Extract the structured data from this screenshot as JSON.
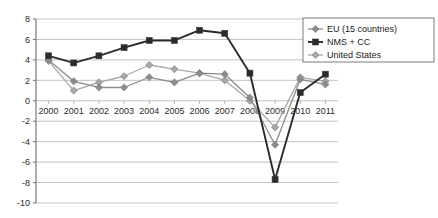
{
  "chart_data": {
    "type": "line",
    "title": "",
    "xlabel": "",
    "ylabel": "",
    "categories": [
      "2000",
      "2001",
      "2002",
      "2003",
      "2004",
      "2005",
      "2006",
      "2007",
      "2008",
      "2009",
      "2010",
      "2011"
    ],
    "x": [
      2000,
      2001,
      2002,
      2003,
      2004,
      2005,
      2006,
      2007,
      2008,
      2009,
      2010,
      2011
    ],
    "ylim": [
      -10,
      8
    ],
    "yticks": [
      8,
      6,
      4,
      2,
      0,
      -2,
      -4,
      -6,
      -8,
      -10
    ],
    "ytick_labels": [
      "8",
      "6",
      "4",
      "2",
      "0",
      "-2",
      "-4",
      "-6",
      "-8",
      "-10"
    ],
    "grid": true,
    "grid_axis": "y",
    "legend_position": "top-right",
    "series": [
      {
        "name": "EU (15 countries)",
        "color": "#8c8c8c",
        "marker": "diamond",
        "values": [
          4.0,
          1.9,
          1.3,
          1.3,
          2.3,
          1.8,
          2.7,
          2.6,
          0.3,
          -4.3,
          2.1,
          1.6
        ]
      },
      {
        "name": "NMS + CC",
        "color": "#2b2b2b",
        "marker": "square",
        "values": [
          4.4,
          3.7,
          4.4,
          5.2,
          5.9,
          5.9,
          6.9,
          6.6,
          2.7,
          -7.7,
          0.8,
          2.6
        ]
      },
      {
        "name": "United States",
        "color": "#a8a8a8",
        "marker": "diamond",
        "values": [
          3.9,
          1.0,
          1.8,
          2.4,
          3.5,
          3.1,
          2.7,
          2.0,
          0.0,
          -2.6,
          2.3,
          1.9
        ]
      }
    ]
  },
  "legend": {
    "items": [
      {
        "label": "EU (15 countries)"
      },
      {
        "label": "NMS + CC"
      },
      {
        "label": "United States"
      }
    ]
  },
  "axes": {
    "y_axis_name": "value-axis",
    "x_axis_name": "year-axis"
  }
}
